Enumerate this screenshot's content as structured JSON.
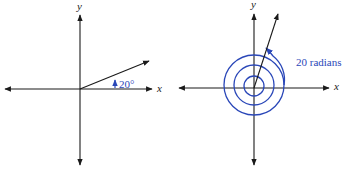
{
  "figures": [
    {
      "id": "left",
      "axis_labels": {
        "x": "x",
        "y": "y"
      },
      "angle_label": "20°",
      "angle_degrees": 20
    },
    {
      "id": "right",
      "axis_labels": {
        "x": "x",
        "y": "y"
      },
      "angle_label": "20 radians",
      "angle_radians": 20
    }
  ],
  "colors": {
    "axis": "#1a1a1a",
    "angle": "#2a47b8"
  }
}
